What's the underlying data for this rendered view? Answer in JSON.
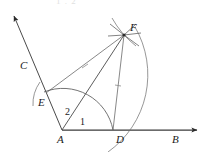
{
  "figure": {
    "kind": "geometry-construction-diagram",
    "title_fragment": "1 . 2",
    "background_color": "#ffffff",
    "stroke_color": "#444444",
    "line_color": "#333333",
    "arc_color": "#555555",
    "label_color": "#1a1a1a",
    "width": 212,
    "height": 152
  },
  "points": [
    {
      "id": "A",
      "label": "A",
      "x": 62,
      "y": 130,
      "label_x": 57,
      "label_y": 134,
      "role": "vertex"
    },
    {
      "id": "B",
      "label": "B",
      "x": 200,
      "y": 130,
      "label_x": 172,
      "label_y": 134,
      "role": "ray-end"
    },
    {
      "id": "C",
      "label": "C",
      "x": 12,
      "y": 13,
      "label_x": 20,
      "label_y": 60,
      "role": "ray-end"
    },
    {
      "id": "D",
      "label": "D",
      "x": 113,
      "y": 130,
      "label_x": 116,
      "label_y": 134,
      "role": "arc-intersection"
    },
    {
      "id": "E",
      "label": "E",
      "x": 46,
      "y": 93,
      "label_x": 38,
      "label_y": 97,
      "role": "arc-intersection"
    },
    {
      "id": "F",
      "label": "F",
      "x": 124,
      "y": 35,
      "label_x": 130,
      "label_y": 22,
      "role": "construction-intersection"
    }
  ],
  "angle_labels": [
    {
      "id": "angle-1",
      "label": "1",
      "x": 80,
      "y": 117
    },
    {
      "id": "angle-2",
      "label": "2",
      "x": 65,
      "y": 107
    }
  ],
  "segments": [
    {
      "id": "ray-AB",
      "from": "A",
      "to": "B",
      "arrow": true
    },
    {
      "id": "ray-AC",
      "from": "A",
      "to": "C",
      "arrow": true
    },
    {
      "id": "segment-AF",
      "from": "A",
      "to": "F",
      "arrow": false
    },
    {
      "id": "segment-EF",
      "from": "E",
      "to": "F",
      "arrow": false,
      "tick": true
    },
    {
      "id": "segment-DF",
      "from": "D",
      "to": "F",
      "arrow": false,
      "tick": true
    }
  ],
  "arcs": [
    {
      "id": "arc-center-A",
      "center": "A",
      "through": [
        "E",
        "D"
      ],
      "radius": 51
    },
    {
      "id": "arc-center-D",
      "center": "D",
      "through": [
        "F"
      ]
    },
    {
      "id": "arc-center-E",
      "center": "E",
      "through": [
        "F"
      ]
    }
  ]
}
